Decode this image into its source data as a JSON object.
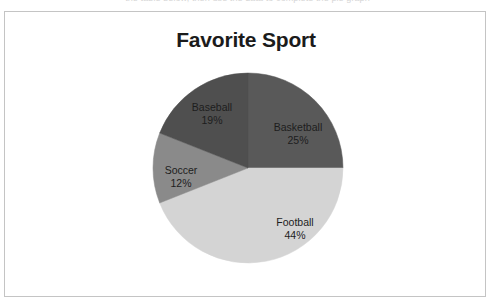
{
  "page": {
    "clipped_header_text": "the table below, then use the data to complete the pie graph"
  },
  "chart": {
    "title": "Favorite Sport",
    "frame_border_color": "#c4c4c4",
    "background_color": "#ffffff"
  },
  "chart_data": {
    "type": "pie",
    "title": "Favorite Sport",
    "xlabel": "",
    "ylabel": "",
    "legend": "none",
    "labels_inside_slices": true,
    "start_angle_deg": 0,
    "direction": "clockwise",
    "categories": [
      "Basketball",
      "Football",
      "Soccer",
      "Baseball"
    ],
    "values": [
      25,
      44,
      12,
      19
    ],
    "value_unit": "percent",
    "total": 100,
    "colors": [
      "#595959",
      "#d4d4d4",
      "#8a8a8a",
      "#4f4f4f"
    ],
    "slices": [
      {
        "label": "Basketball",
        "percent": 25,
        "percent_text": "25%",
        "color": "#595959",
        "sweep_deg": 90.0,
        "start_deg": 0.0
      },
      {
        "label": "Football",
        "percent": 44,
        "percent_text": "44%",
        "color": "#d4d4d4",
        "sweep_deg": 158.4,
        "start_deg": 90.0
      },
      {
        "label": "Soccer",
        "percent": 12,
        "percent_text": "12%",
        "color": "#8a8a8a",
        "sweep_deg": 43.2,
        "start_deg": 248.4
      },
      {
        "label": "Baseball",
        "percent": 19,
        "percent_text": "19%",
        "color": "#4f4f4f",
        "sweep_deg": 68.4,
        "start_deg": 291.6
      }
    ]
  }
}
